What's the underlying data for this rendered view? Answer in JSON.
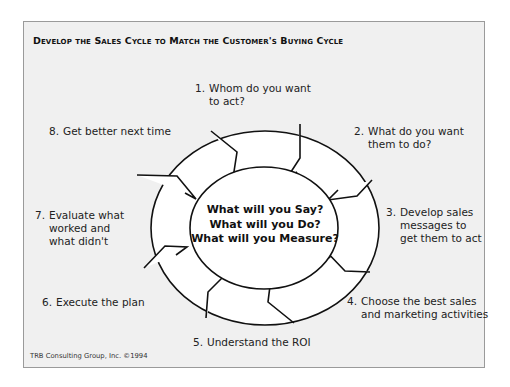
{
  "title": "Develop the Sales Cycle to Match the Customer's Buying Cycle",
  "center_text": {
    "line1": "What will you Say?",
    "line2": "What will you Do?",
    "line3": "What will you Measure?"
  },
  "steps": [
    {
      "num": "1.",
      "line1": "Whom do you want",
      "line2": "to act?"
    },
    {
      "num": "2.",
      "line1": "What do you want",
      "line2": "them to do?"
    },
    {
      "num": "3.",
      "line1": "Develop sales",
      "line2": "messages to",
      "line3": "get them to act"
    },
    {
      "num": "4.",
      "line1": "Choose the best sales",
      "line2": "and marketing activities"
    },
    {
      "num": "5.",
      "line1": "Understand the ROI"
    },
    {
      "num": "6.",
      "line1": "Execute the plan"
    },
    {
      "num": "7.",
      "line1": "Evaluate what",
      "line2": "worked and",
      "line3": "what didn't"
    },
    {
      "num": "8.",
      "line1": "Get better next time"
    }
  ],
  "footer": "TRB Consulting Group, Inc. ©1994",
  "colors": {
    "panel_bg": "#f0f0f0",
    "panel_border": "#9a9a9a",
    "ring_fill": "#ffffff",
    "ring_stroke": "#111111"
  }
}
